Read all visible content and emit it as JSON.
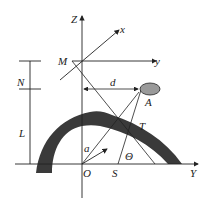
{
  "diagram": {
    "labels": {
      "Z": "Z",
      "x": "x",
      "y": "y",
      "M": "M",
      "N": "N",
      "d": "d",
      "A": "A",
      "L": "L",
      "T": "T",
      "a": "a",
      "theta": "Θ",
      "O": "O",
      "S": "S",
      "Y": "Y"
    },
    "colors": {
      "line": "#222222",
      "arch_fill": "#3a3a3a",
      "ellipse_fill": "#9a9a9a"
    }
  }
}
